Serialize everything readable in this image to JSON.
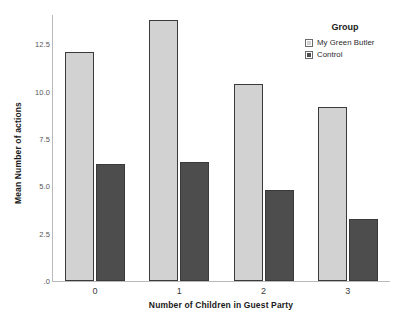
{
  "chart_data": {
    "type": "bar",
    "title": "",
    "xlabel": "Number of Children in Guest Party",
    "ylabel": "Mean Number of actions",
    "categories": [
      "0",
      "1",
      "2",
      "3"
    ],
    "series": [
      {
        "name": "My Green Butler",
        "color": "#d2d2d2",
        "values": [
          12.1,
          13.8,
          10.4,
          9.2
        ]
      },
      {
        "name": "Control",
        "color": "#4d4d4d",
        "values": [
          6.2,
          6.3,
          4.8,
          3.3
        ]
      }
    ],
    "ylim": [
      0,
      14.05
    ],
    "yticks": [
      ".0",
      "2.5",
      "5.0",
      "7.5",
      "10.0",
      "12.5"
    ],
    "ytick_values": [
      0,
      2.5,
      5.0,
      7.5,
      10.0,
      12.5
    ],
    "grid": false,
    "legend_position": "right"
  },
  "legend": {
    "title": "Group",
    "entries": [
      {
        "label": "My Green Butler",
        "color": "#d2d2d2"
      },
      {
        "label": "Control",
        "color": "#4d4d4d"
      }
    ]
  }
}
